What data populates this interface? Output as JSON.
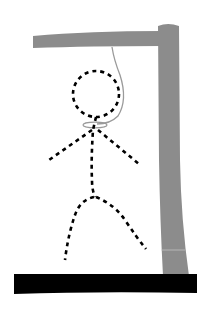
{
  "illustration": {
    "subject": "hangman drawing",
    "colors": {
      "background": "#ffffff",
      "gallows": "#8c8c8c",
      "base": "#000000",
      "rope": "#9a9a9a",
      "figure": "#000000"
    }
  }
}
